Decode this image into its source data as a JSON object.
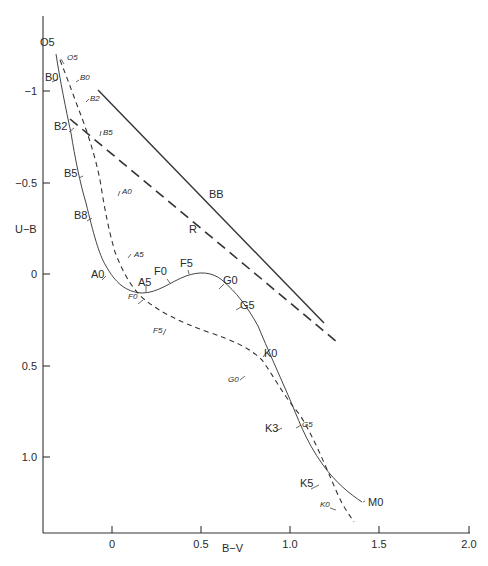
{
  "chart_data": {
    "type": "line",
    "title": "",
    "xlabel": "B−V",
    "ylabel": "U−B",
    "xlim": [
      -0.35,
      2.0
    ],
    "ylim": [
      1.4,
      -1.3
    ],
    "y_inverted": true,
    "x_ticks": [
      "0",
      "0.5",
      "1.0",
      "1.5",
      "2.0"
    ],
    "y_ticks": [
      "−1",
      "−0.5",
      "0",
      "0.5",
      "1.0"
    ],
    "grid": false,
    "series": [
      {
        "name": "Main sequence (solid)",
        "style": "solid",
        "points": [
          {
            "label": "O5",
            "bv": -0.3,
            "ub": -1.17
          },
          {
            "label": "B0",
            "bv": -0.27,
            "ub": -1.05
          },
          {
            "label": "B2",
            "bv": -0.22,
            "ub": -0.84
          },
          {
            "label": "B5",
            "bv": -0.15,
            "ub": -0.56
          },
          {
            "label": "B8",
            "bv": -0.08,
            "ub": -0.33
          },
          {
            "label": "A0",
            "bv": 0.0,
            "ub": -0.02
          },
          {
            "label": "A5",
            "bv": 0.15,
            "ub": 0.1
          },
          {
            "label": "F0",
            "bv": 0.3,
            "ub": 0.03
          },
          {
            "label": "F5",
            "bv": 0.43,
            "ub": -0.01
          },
          {
            "label": "G0",
            "bv": 0.59,
            "ub": 0.07
          },
          {
            "label": "G5",
            "bv": 0.68,
            "ub": 0.21
          },
          {
            "label": "K0",
            "bv": 0.83,
            "ub": 0.46
          },
          {
            "label": "K3",
            "bv": 0.96,
            "ub": 0.78
          },
          {
            "label": "K5",
            "bv": 1.16,
            "ub": 1.1
          },
          {
            "label": "M0",
            "bv": 1.4,
            "ub": 1.22
          }
        ]
      },
      {
        "name": "Supergiants (dashed)",
        "style": "dashed",
        "points": [
          {
            "label": "O5",
            "bv": -0.28,
            "ub": -1.16
          },
          {
            "label": "B0",
            "bv": -0.2,
            "ub": -1.07
          },
          {
            "label": "B2",
            "bv": -0.14,
            "ub": -0.94
          },
          {
            "label": "B5",
            "bv": -0.07,
            "ub": -0.74
          },
          {
            "label": "A0",
            "bv": 0.03,
            "ub": -0.45
          },
          {
            "label": "A5",
            "bv": 0.1,
            "ub": -0.13
          },
          {
            "label": "F0",
            "bv": 0.17,
            "ub": 0.14
          },
          {
            "label": "F5",
            "bv": 0.31,
            "ub": 0.29
          },
          {
            "label": "G0",
            "bv": 0.76,
            "ub": 0.54
          },
          {
            "label": "G5",
            "bv": 1.03,
            "ub": 0.82
          },
          {
            "label": "K0",
            "bv": 1.22,
            "ub": 1.15
          }
        ]
      },
      {
        "name": "BB",
        "style": "solid-line",
        "points": [
          {
            "bv": -0.08,
            "ub": -1.0
          },
          {
            "bv": 1.19,
            "ub": 0.27
          }
        ]
      },
      {
        "name": "R",
        "style": "long-dashed-line",
        "points": [
          {
            "bv": -0.23,
            "ub": -0.85
          },
          {
            "bv": 1.26,
            "ub": 0.37
          }
        ]
      }
    ],
    "annotations": [
      "BB",
      "R",
      "O5",
      "B0",
      "B2",
      "B5",
      "B8",
      "A0",
      "A5",
      "F0",
      "F5",
      "G0",
      "G5",
      "K0",
      "K3",
      "K5",
      "M0"
    ]
  },
  "axes": {
    "xlabel": "B−V",
    "ylabel": "U−B",
    "x_ticks": [
      {
        "label": "0",
        "x": 112
      },
      {
        "label": "0.5",
        "x": 201
      },
      {
        "label": "1.0",
        "x": 290
      },
      {
        "label": "1.5",
        "x": 379
      },
      {
        "label": "2.0",
        "x": 469
      }
    ],
    "y_ticks": [
      {
        "label": "−1",
        "y": 91
      },
      {
        "label": "−0.5",
        "y": 183
      },
      {
        "label": "0",
        "y": 274
      },
      {
        "label": "0.5",
        "y": 366
      },
      {
        "label": "1.0",
        "y": 457
      }
    ]
  },
  "lines": {
    "bb_label": "BB",
    "r_label": "R"
  },
  "paths": {
    "solid_ms": "M56,54 C60,80 66,110 71,133 C75,158 80,183 86,203 C93,232 99,255 106,266 C115,282 125,292 142,293 C158,293 170,282 186,276 C200,271 212,272 222,280 C236,292 247,306 258,326 C268,350 278,372 288,395 C298,418 305,440 323,465 C336,483 350,494 362,502",
    "dashed_sg": "M60,60 C68,80 75,100 82,118 C90,140 96,160 100,180 C104,205 108,228 115,252 C122,270 130,287 145,300 C160,312 180,322 208,332 C232,340 250,348 262,360 C275,378 283,395 300,415 C315,440 325,465 338,495 C344,508 350,516 354,522",
    "bb_line": "M98,90 L324,323",
    "r_line": "M70,119 L337,342"
  },
  "labels": {
    "solid": [
      {
        "text": "O5",
        "x": 40,
        "y": 46
      },
      {
        "text": "B0",
        "x": 45,
        "y": 81
      },
      {
        "text": "B2",
        "x": 54,
        "y": 130
      },
      {
        "text": "B5",
        "x": 64,
        "y": 177
      },
      {
        "text": "B8",
        "x": 74,
        "y": 219
      },
      {
        "text": "A0",
        "x": 91,
        "y": 278
      },
      {
        "text": "A5",
        "x": 138,
        "y": 286
      },
      {
        "text": "F0",
        "x": 154,
        "y": 275
      },
      {
        "text": "F5",
        "x": 180,
        "y": 267
      },
      {
        "text": "G0",
        "x": 223,
        "y": 284
      },
      {
        "text": "G5",
        "x": 240,
        "y": 309
      },
      {
        "text": "K0",
        "x": 264,
        "y": 357
      },
      {
        "text": "K3",
        "x": 265,
        "y": 432
      },
      {
        "text": "K5",
        "x": 300,
        "y": 487
      },
      {
        "text": "M0",
        "x": 368,
        "y": 506
      }
    ],
    "dashed": [
      {
        "text": "O5",
        "x": 67,
        "y": 60
      },
      {
        "text": "B0",
        "x": 80,
        "y": 80
      },
      {
        "text": "B2",
        "x": 90,
        "y": 101
      },
      {
        "text": "B5",
        "x": 103,
        "y": 135
      },
      {
        "text": "A0",
        "x": 122,
        "y": 194
      },
      {
        "text": "A5",
        "x": 134,
        "y": 257
      },
      {
        "text": "F0",
        "x": 128,
        "y": 299
      },
      {
        "text": "F5",
        "x": 153,
        "y": 333
      },
      {
        "text": "G0",
        "x": 228,
        "y": 382
      },
      {
        "text": "G5",
        "x": 302,
        "y": 427
      },
      {
        "text": "K0",
        "x": 320,
        "y": 507
      }
    ],
    "bb": {
      "text": "BB",
      "x": 209,
      "y": 198
    },
    "r": {
      "text": "R",
      "x": 189,
      "y": 233
    }
  },
  "ticks": {
    "solid": [
      "M52,82 L58,79",
      "M69,132 L74,128",
      "M79,178 L83,176",
      "M87,221 L92,218",
      "M102,280 L106,276",
      "M146,292 L146,285",
      "M170,283 L167,279",
      "M189,274 L188,270",
      "M219,289 L224,284",
      "M236,310 L241,307",
      "M263,357 L266,353",
      "M276,431 L282,428",
      "M311,489 L319,485",
      "M363,502 L365,501"
    ],
    "dashed": [
      "M64,64 L61,59",
      "M76,82 L79,80",
      "M86,102 L89,99",
      "M100,136 L101,131",
      "M118,196 L120,191",
      "M128,258 L131,254",
      "M138,304 L143,300",
      "M163,335 L166,329",
      "M240,380 L245,376",
      "M296,428 L301,425",
      "M330,508 L336,510"
    ]
  }
}
